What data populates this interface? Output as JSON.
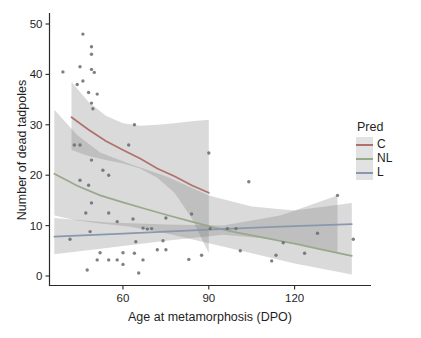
{
  "figure": {
    "background": "#ffffff",
    "axis_color": "#2a2a2a",
    "text_color": "#1f1f1f"
  },
  "legend": {
    "title": "Pred",
    "items": [
      {
        "label": "C",
        "color": "#b0716b"
      },
      {
        "label": "NL",
        "color": "#98a98b"
      },
      {
        "label": "L",
        "color": "#8899ad"
      }
    ]
  },
  "chart_data": {
    "type": "scatter",
    "title": "",
    "xlabel": "Age at metamorphosis (DPO)",
    "ylabel": "Number of dead tadpoles",
    "xlim": [
      34.5,
      146
    ],
    "ylim": [
      0,
      52
    ],
    "x_ticks": [
      60,
      90,
      120
    ],
    "y_ticks": [
      0,
      10,
      20,
      30,
      40,
      50
    ],
    "grid": false,
    "legend_position": "right",
    "point_color": "#6a6a6a",
    "ribbon_color": "rgba(118,118,118,0.27)",
    "points": [
      [
        46,
        48
      ],
      [
        49,
        45.5
      ],
      [
        49,
        44
      ],
      [
        45,
        41.5
      ],
      [
        39,
        40.5
      ],
      [
        49,
        41
      ],
      [
        50,
        40.4
      ],
      [
        46,
        38.7
      ],
      [
        44,
        38
      ],
      [
        48,
        36.4
      ],
      [
        51,
        36.1
      ],
      [
        49,
        34.3
      ],
      [
        49.5,
        33.2
      ],
      [
        64,
        30
      ],
      [
        43,
        26
      ],
      [
        45,
        26
      ],
      [
        62,
        26
      ],
      [
        49,
        23
      ],
      [
        90,
        24.4
      ],
      [
        53,
        21
      ],
      [
        55,
        20
      ],
      [
        45,
        19
      ],
      [
        48,
        18
      ],
      [
        104,
        18.7
      ],
      [
        135,
        16
      ],
      [
        49,
        14.5
      ],
      [
        47,
        12.5
      ],
      [
        55,
        12.5
      ],
      [
        58,
        10.8
      ],
      [
        63.5,
        11.3
      ],
      [
        75,
        11.5
      ],
      [
        84,
        12.3
      ],
      [
        48.5,
        8.8
      ],
      [
        67,
        9.5
      ],
      [
        68.5,
        9.3
      ],
      [
        70,
        9.4
      ],
      [
        90.5,
        9.4
      ],
      [
        96.5,
        9.4
      ],
      [
        99.5,
        9.4
      ],
      [
        128,
        8.5
      ],
      [
        140.5,
        7.3
      ],
      [
        41.5,
        7.3
      ],
      [
        64.5,
        6.8
      ],
      [
        74,
        7
      ],
      [
        116,
        6.6
      ],
      [
        101,
        5
      ],
      [
        123.5,
        4.5
      ],
      [
        112,
        3
      ],
      [
        113.5,
        4.1
      ],
      [
        72,
        5.2
      ],
      [
        75,
        5.2
      ],
      [
        60,
        4.6
      ],
      [
        64,
        4.5
      ],
      [
        52,
        4.6
      ],
      [
        55,
        3.2
      ],
      [
        51,
        3.2
      ],
      [
        58,
        3.2
      ],
      [
        67,
        3.2
      ],
      [
        83,
        3.3
      ],
      [
        87.5,
        4.1
      ],
      [
        60,
        2.3
      ],
      [
        47.5,
        1.2
      ],
      [
        65.5,
        0.6
      ]
    ],
    "smooth_series": [
      {
        "name": "C",
        "color": "#b0716b",
        "line": [
          [
            42,
            31.5
          ],
          [
            48,
            29
          ],
          [
            54,
            26.8
          ],
          [
            60,
            25
          ],
          [
            66,
            23.3
          ],
          [
            72,
            21.3
          ],
          [
            78,
            19.8
          ],
          [
            84,
            18
          ],
          [
            90,
            16.5
          ]
        ],
        "ribbon": {
          "x": [
            42,
            48,
            54,
            60,
            66,
            72,
            78,
            84,
            90
          ],
          "top": [
            38.5,
            34.5,
            31.8,
            30.3,
            29.8,
            30,
            30.3,
            30.7,
            31
          ],
          "bottom": [
            25,
            23.8,
            23,
            22.3,
            21.3,
            19.5,
            16.5,
            11.5,
            4.5
          ]
        }
      },
      {
        "name": "NL",
        "color": "#98a98b",
        "line": [
          [
            36,
            20.3
          ],
          [
            44,
            17.9
          ],
          [
            52,
            16
          ],
          [
            60,
            14.6
          ],
          [
            68,
            13.3
          ],
          [
            76,
            12
          ],
          [
            84,
            10.8
          ],
          [
            92,
            9.6
          ],
          [
            100,
            8.6
          ],
          [
            110,
            7.5
          ],
          [
            120,
            6.4
          ],
          [
            130,
            5.2
          ],
          [
            140,
            4
          ]
        ],
        "ribbon": {
          "x": [
            36,
            44,
            52,
            62,
            75,
            90,
            105,
            120,
            140
          ],
          "top": [
            33,
            28,
            24.5,
            22.3,
            19.8,
            16,
            13.8,
            13,
            14.5
          ],
          "bottom": [
            12,
            11,
            10.4,
            9.8,
            8.5,
            6.5,
            4.5,
            2.5,
            0.3
          ]
        }
      },
      {
        "name": "L",
        "color": "#8899ad",
        "line": [
          [
            36,
            7.8
          ],
          [
            60,
            8.4
          ],
          [
            90,
            9.2
          ],
          [
            115,
            9.8
          ],
          [
            140,
            10.3
          ]
        ],
        "ribbon": {
          "x": [
            36,
            55,
            75,
            95,
            115,
            135
          ],
          "top": [
            11.5,
            10.6,
            10.2,
            10,
            12,
            16
          ],
          "bottom": [
            4.3,
            5.6,
            7,
            8.2,
            7.2,
            4.6
          ]
        }
      }
    ]
  }
}
